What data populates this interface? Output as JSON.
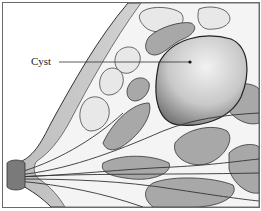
{
  "figure": {
    "labels": [
      {
        "text": "Cyst",
        "target": "cyst"
      }
    ]
  },
  "colors": {
    "border": "#6a6a6a",
    "skin": "#d8d8d8",
    "fat": "#f2f2f2",
    "lobule": "#bdbdbd",
    "lobule_dark": "#8a8a8a",
    "cyst": "#cfcfcf",
    "line": "#333333"
  }
}
